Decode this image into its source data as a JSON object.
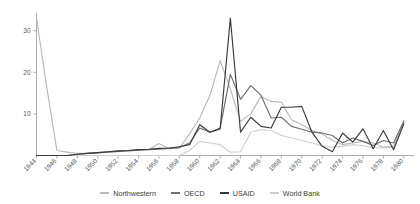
{
  "chart_data": {
    "type": "line",
    "title": "",
    "subtitle": "",
    "xlabel": "",
    "ylabel": "",
    "xlim": [
      1944,
      1981
    ],
    "ylim": [
      0,
      34
    ],
    "grid": false,
    "legend_position": "bottom",
    "y_ticks": [
      10,
      20,
      30
    ],
    "y_tick_labels": [
      "10",
      "20",
      "30"
    ],
    "x_ticks": [
      1944,
      1946,
      1948,
      1950,
      1952,
      1954,
      1956,
      1958,
      1960,
      1962,
      1964,
      1966,
      1968,
      1970,
      1972,
      1974,
      1976,
      1978,
      1980
    ],
    "x_tick_labels": [
      "1944",
      "1946",
      "1948",
      "1950",
      "1952",
      "1954",
      "1956",
      "1958",
      "1960",
      "1962",
      "1964",
      "1966",
      "1968",
      "1970",
      "1972",
      "1974",
      "1976",
      "1978",
      "1980"
    ],
    "x": [
      1944,
      1945,
      1946,
      1947,
      1948,
      1949,
      1950,
      1951,
      1952,
      1953,
      1954,
      1955,
      1956,
      1957,
      1958,
      1959,
      1960,
      1961,
      1962,
      1963,
      1964,
      1965,
      1966,
      1967,
      1968,
      1969,
      1970,
      1971,
      1972,
      1973,
      1974,
      1975,
      1976,
      1977,
      1978,
      1979,
      1980
    ],
    "series": [
      {
        "name": "Northwestern",
        "color": "#b9b9bb",
        "values": [
          33.0,
          16.5,
          1.2,
          0.8,
          0.5,
          0.5,
          0.6,
          0.8,
          1.0,
          1.2,
          1.3,
          1.4,
          2.9,
          1.6,
          1.8,
          5.2,
          9.0,
          14.5,
          22.8,
          16.0,
          8.2,
          10.0,
          14.2,
          13.0,
          12.8,
          8.6,
          7.4,
          6.0,
          5.2,
          3.6,
          2.6,
          3.0,
          3.4,
          3.0,
          2.0,
          2.2,
          8.0
        ]
      },
      {
        "name": "OECD",
        "color": "#6e6e70",
        "values": [
          0.0,
          0.0,
          0.0,
          0.0,
          0.3,
          0.5,
          0.7,
          0.8,
          1.0,
          1.1,
          1.3,
          1.4,
          1.5,
          1.7,
          1.9,
          3.0,
          6.6,
          5.6,
          6.6,
          19.5,
          13.5,
          16.8,
          14.5,
          9.0,
          9.2,
          7.0,
          6.3,
          5.6,
          5.4,
          4.8,
          3.0,
          4.2,
          3.4,
          2.4,
          3.6,
          3.0,
          8.3
        ]
      },
      {
        "name": "USAID",
        "color": "#3a3a3c",
        "values": [
          0.0,
          0.0,
          0.0,
          0.0,
          0.3,
          0.5,
          0.7,
          0.9,
          1.1,
          1.2,
          1.4,
          1.5,
          1.7,
          1.8,
          2.1,
          2.6,
          7.4,
          5.6,
          6.4,
          33.0,
          5.6,
          9.2,
          7.0,
          6.6,
          11.6,
          11.6,
          11.8,
          5.6,
          2.2,
          0.9,
          5.4,
          3.2,
          6.4,
          1.6,
          6.0,
          1.4,
          7.6
        ]
      },
      {
        "name": "World Bank",
        "color": "#cfcfd1",
        "values": [
          0.0,
          0.0,
          0.0,
          0.0,
          0.0,
          0.0,
          0.0,
          0.0,
          0.0,
          0.0,
          0.0,
          0.0,
          0.0,
          0.0,
          0.0,
          1.2,
          3.4,
          3.0,
          2.6,
          0.8,
          0.9,
          5.6,
          6.2,
          6.0,
          4.8,
          4.2,
          3.6,
          3.0,
          2.3,
          2.0,
          2.2,
          2.6,
          2.4,
          1.9,
          1.8,
          2.0,
          7.8
        ]
      }
    ]
  },
  "legend": {
    "items": [
      {
        "label": "Northwestern",
        "color": "#b9b9bb"
      },
      {
        "label": "OECD",
        "color": "#6e6e70"
      },
      {
        "label": "USAID",
        "color": "#3a3a3c"
      },
      {
        "label": "World Bank",
        "color": "#cfcfd1"
      }
    ]
  }
}
